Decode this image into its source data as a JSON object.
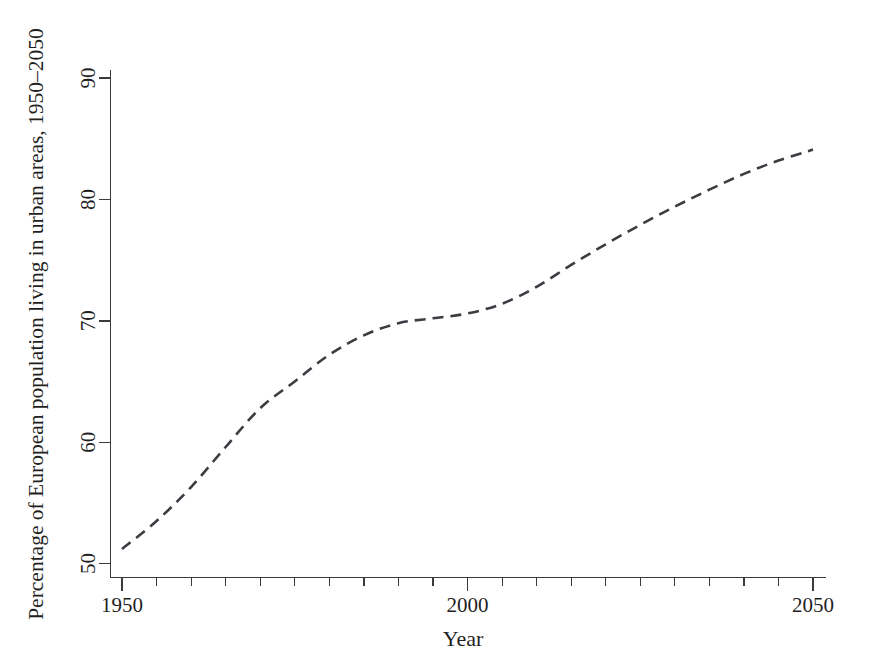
{
  "chart_data": {
    "type": "line",
    "title": "",
    "subtitle": "",
    "xlabel": "Year",
    "ylabel": "Percentage of European population living in urban areas, 1950–2050",
    "xlim": [
      1950,
      2050
    ],
    "ylim": [
      50,
      90
    ],
    "grid": false,
    "legend": null,
    "legend_position": "none",
    "line_style": "dashed",
    "line_color": "#3c3c42",
    "x_tick_labels": [
      "1950",
      "2000",
      "2050"
    ],
    "x_major_ticks": [
      1950,
      2000,
      2050
    ],
    "x_minor_ticks": [
      1955,
      1960,
      1965,
      1970,
      1975,
      1980,
      1985,
      1990,
      1995,
      2005,
      2010,
      2015,
      2020,
      2025,
      2030,
      2035,
      2040,
      2045
    ],
    "y_tick_labels": [
      "50",
      "60",
      "70",
      "80",
      "90"
    ],
    "y_major_ticks": [
      50,
      60,
      70,
      80,
      90
    ],
    "x": [
      1950,
      1955,
      1960,
      1965,
      1970,
      1975,
      1980,
      1985,
      1990,
      1995,
      2000,
      2005,
      2010,
      2015,
      2020,
      2025,
      2030,
      2035,
      2040,
      2045,
      2050
    ],
    "values": [
      51.2,
      53.5,
      56.3,
      59.6,
      62.8,
      65.0,
      67.2,
      68.8,
      69.8,
      70.2,
      70.6,
      71.4,
      72.8,
      74.6,
      76.3,
      77.9,
      79.4,
      80.8,
      82.1,
      83.2,
      84.1
    ],
    "series": [
      {
        "name": "European urban population share",
        "values": [
          51.2,
          53.5,
          56.3,
          59.6,
          62.8,
          65.0,
          67.2,
          68.8,
          69.8,
          70.2,
          70.6,
          71.4,
          72.8,
          74.6,
          76.3,
          77.9,
          79.4,
          80.8,
          82.1,
          83.2,
          84.1
        ]
      }
    ],
    "annotations": []
  },
  "axes": {
    "x_title": "Year",
    "y_title": "Percentage of European population living in urban areas, 1950–2050",
    "x_labels": [
      {
        "text": "1950",
        "value": 1950
      },
      {
        "text": "2000",
        "value": 2000
      },
      {
        "text": "2050",
        "value": 2050
      }
    ],
    "y_labels": [
      {
        "text": "50",
        "value": 50
      },
      {
        "text": "60",
        "value": 60
      },
      {
        "text": "70",
        "value": 70
      },
      {
        "text": "80",
        "value": 80
      },
      {
        "text": "90",
        "value": 90
      }
    ]
  },
  "colors": {
    "background": "#ffffff",
    "axis": "#3a3a3a",
    "line": "#3c3c42",
    "text": "#1f1f1f"
  }
}
